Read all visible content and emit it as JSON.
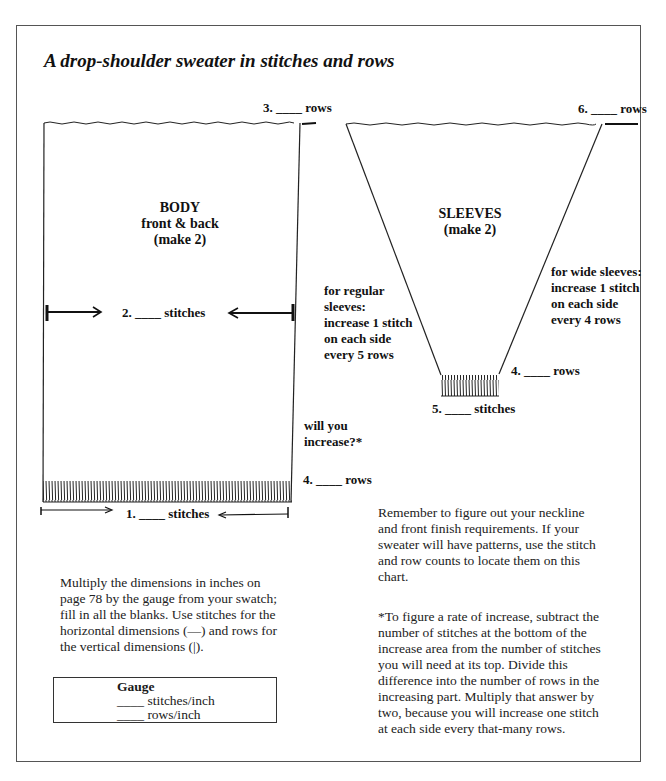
{
  "title": "A drop-shoulder sweater in stitches and rows",
  "body_piece": {
    "name": "BODY",
    "subtitle": "front & back",
    "note": "(make 2)",
    "label_width_chest": "2. ____ stitches",
    "label_width_bottom": "1. ____ stitches",
    "label_length": "3. ____ rows",
    "label_ribbing": "4. ____ rows",
    "increase_question": [
      "will you",
      "increase?*"
    ]
  },
  "sleeve_piece": {
    "name": "SLEEVES",
    "note": "(make 2)",
    "label_length": "6. ____ rows",
    "label_cuff_rows": "4. ____ rows",
    "label_cuff_stitches": "5. ____ stitches",
    "regular_sleeves": [
      "for regular",
      "sleeves:",
      "increase 1 stitch",
      "on each side",
      "every 5 rows"
    ],
    "wide_sleeves": [
      "for wide sleeves:",
      "increase 1 stitch",
      "on each side",
      "every 4 rows"
    ]
  },
  "instructions": [
    "Multiply the dimensions in inches on",
    "page 78 by the gauge from your swatch;",
    "fill in all the blanks. Use stitches for the",
    "horizontal dimensions (—) and rows for",
    "the vertical dimensions (|)."
  ],
  "reminder": [
    "Remember to figure out your neckline",
    "and front finish requirements. If your",
    "sweater will have patterns, use the stitch",
    "and row counts to locate them on this",
    "chart."
  ],
  "footnote": [
    "*To figure a rate of increase, subtract the",
    "number of stitches at the bottom of the",
    "increase area from the number of stitches",
    "you will need at its top. Divide this",
    "difference into the number of rows in the",
    "increasing part. Multiply that answer by",
    "two, because you will increase one stitch",
    "at each side every that-many rows."
  ],
  "gauge": {
    "title": "Gauge",
    "stitches": "____ stitches/inch",
    "rows": "____ rows/inch"
  }
}
